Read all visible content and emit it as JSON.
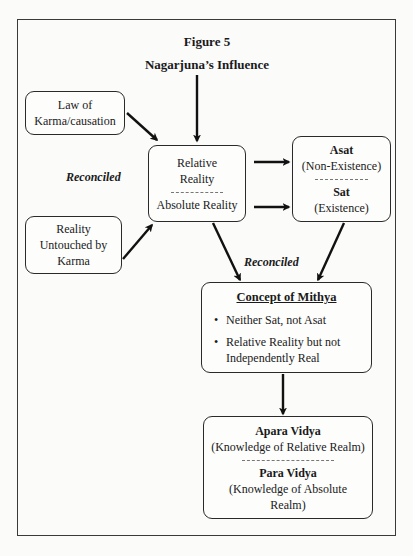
{
  "figure": {
    "title": "Figure 5",
    "subtitle": "Nagarjuna’s Influence"
  },
  "nodes": {
    "law_of_karma": {
      "line1": "Law of",
      "line2": "Karma/causation"
    },
    "reality_untouched": {
      "line1": "Reality",
      "line2": "Untouched by",
      "line3": "Karma"
    },
    "relative_absolute": {
      "top_line1": "Relative",
      "top_line2": "Reality",
      "bottom": "Absolute Reality"
    },
    "asat_sat": {
      "top_title": "Asat",
      "top_sub": "(Non-Existence)",
      "bottom_title": "Sat",
      "bottom_sub": "(Existence)"
    },
    "mithya": {
      "title": "Concept of Mithya",
      "bullets": [
        "Neither Sat, not Asat",
        "Relative Reality but not Independently Real"
      ]
    },
    "vidya": {
      "top_title": "Apara Vidya",
      "top_sub": "(Knowledge of Relative Realm)",
      "bottom_title": "Para Vidya",
      "bottom_sub_line1": "(Knowledge of Absolute",
      "bottom_sub_line2": "Realm)"
    }
  },
  "edge_labels": {
    "left": "Reconciled",
    "lower": "Reconciled"
  },
  "edges": [
    {
      "from": "subtitle",
      "to": "relative_absolute"
    },
    {
      "from": "law_of_karma",
      "to": "relative_absolute"
    },
    {
      "from": "reality_untouched",
      "to": "relative_absolute"
    },
    {
      "from": "relative_absolute",
      "to": "asat_sat",
      "note": "upper arrow"
    },
    {
      "from": "relative_absolute",
      "to": "asat_sat",
      "note": "lower arrow"
    },
    {
      "from": "relative_absolute",
      "to": "mithya"
    },
    {
      "from": "asat_sat",
      "to": "mithya"
    },
    {
      "from": "mithya",
      "to": "vidya"
    }
  ]
}
